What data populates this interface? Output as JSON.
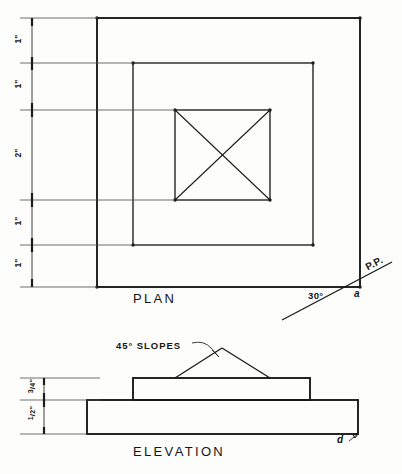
{
  "drawing": {
    "sheet_size": {
      "width": 402,
      "height": 474
    },
    "ink_color": "#1b1b1b",
    "paper_color": "#fdfdfb"
  },
  "plan": {
    "title": "PLAN",
    "dimension_labels": [
      "1\"",
      "1\"",
      "2\"",
      "1\"",
      "1\""
    ],
    "angle_label": "30°",
    "picture_plane_label": "P.P.",
    "point_label": "a",
    "squares": [
      {
        "name": "outer-square",
        "x": 97,
        "y": 18,
        "w": 263,
        "h": 269
      },
      {
        "name": "middle-square",
        "x": 133,
        "y": 63,
        "w": 180,
        "h": 182
      },
      {
        "name": "inner-square",
        "x": 175,
        "y": 110,
        "w": 95,
        "h": 90
      }
    ],
    "inner_square_has_diagonals": true
  },
  "elevation": {
    "title": "ELEVATION",
    "slope_note": "45° SLOPES",
    "dimension_labels": [
      "3/4\"",
      "1/2\""
    ],
    "dimension_labels_display": [
      {
        "num": "3",
        "den": "4",
        "unit": "\""
      },
      {
        "num": "1",
        "den": "2",
        "unit": "\""
      }
    ],
    "point_label": "d",
    "base_slab": {
      "x": 87,
      "y": 400,
      "w": 271,
      "h": 34
    },
    "upper_block": {
      "x": 133,
      "y": 378,
      "w": 177,
      "h": 22
    },
    "roof_apex": {
      "x": 222,
      "y": 348
    }
  }
}
